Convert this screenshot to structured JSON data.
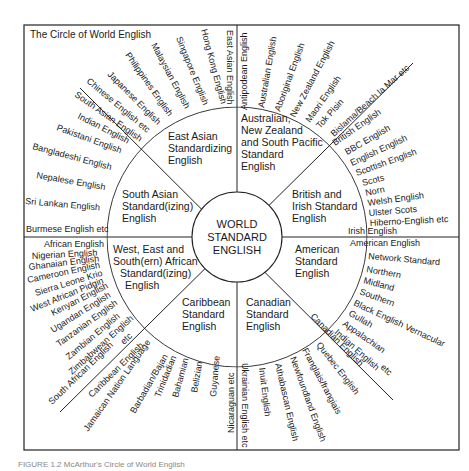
{
  "title": "The Circle of World English",
  "center": [
    "WORLD",
    "STANDARD",
    "ENGLISH"
  ],
  "caption": "FIGURE 1.2 McArthur's Circle of World English",
  "regions": {
    "east_asian": [
      "East Asian",
      "Standardizing",
      "English"
    ],
    "australian": [
      "Australian,",
      "New Zealand",
      "and South Pacific",
      "Standard",
      "English"
    ],
    "south_asian": [
      "South Asian",
      "Standard(izing)",
      "English"
    ],
    "british": [
      "British and",
      "Irish Standard",
      "English"
    ],
    "african": [
      "West, East and",
      "South(ern) African",
      "Standard(izing)",
      "English"
    ],
    "american": [
      "American",
      "Standard",
      "English"
    ],
    "caribbean": [
      "Caribbean",
      "Standard",
      "English"
    ],
    "canadian": [
      "Canadian",
      "Standard",
      "English"
    ]
  },
  "varieties": {
    "east_asian": [
      "East Asian English",
      "Hong Kong English",
      "Singapore English",
      "Malaysian English",
      "Philippines English",
      "Japanese English",
      "Chinese English  etc"
    ],
    "australian": [
      "Antipodean English",
      "Australian English",
      "Aboriginal English",
      "New Zealand English",
      "Maori English",
      "Tok Pisin",
      "Bislama/Beach la Mar  etc"
    ],
    "british": [
      "British English",
      "BBC English",
      "English English",
      "Scottish English",
      "Scots",
      "Norn",
      "Welsh English",
      "Ulster Scots",
      "Hiberno-English etc",
      "Irish English"
    ],
    "south_asian": [
      "South Asian English",
      "Indian English",
      "Pakistani English",
      "Bangladeshi English",
      "Nepalese English",
      "Sri Lankan English",
      "Burmese English  etc"
    ],
    "african": [
      "African English",
      "Nigerian English",
      "Ghanaian English",
      "Cameroon English",
      "Sierra Leone Krio",
      "West African Pidgin",
      "Kenyan English",
      "Ugandan English",
      "Tanzanian English",
      "Zambian English",
      "Zimbabwean English",
      "etc",
      "South African English"
    ],
    "american": [
      "American English",
      "Network Standard",
      "Northern",
      "Midland",
      "Southern",
      "Black English Vernacular",
      "Gullah",
      "Appalachian",
      "Indian English",
      "etc"
    ],
    "caribbean": [
      "Caribbean English",
      "Jamaican Nation Language",
      "Barbadian/Bajan",
      "Trinidadian",
      "Bahamian",
      "Belizian",
      "Guyanese",
      "Nicaraguan  etc"
    ],
    "canadian": [
      "Canadian English",
      "Quebec English",
      "Franglais/frangiais",
      "Newfoundland English",
      "Athabascan English",
      "Inuit English",
      "Ukrainian English  etc"
    ]
  }
}
